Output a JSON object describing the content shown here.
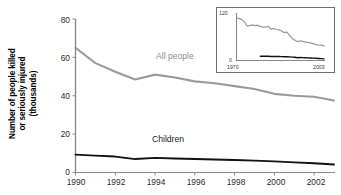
{
  "chart_data": {
    "type": "line",
    "title": "",
    "xlabel": "",
    "ylabel": "Number of people killed or seriously injured (thousands)",
    "ylabel_lines": [
      "Number of people killed",
      "or seriously injured",
      "(thousands)"
    ],
    "xlim": [
      1990,
      2003
    ],
    "ylim": [
      0,
      80
    ],
    "grid": false,
    "legend_position": "inline-annotations",
    "x_ticks": [
      "1990",
      "1992",
      "1994",
      "1996",
      "1998",
      "2000",
      "2002"
    ],
    "x_tick_values": [
      1990,
      1992,
      1994,
      1996,
      1998,
      2000,
      2002
    ],
    "y_ticks": [
      "0",
      "20",
      "40",
      "60",
      "80"
    ],
    "y_tick_values": [
      0,
      20,
      40,
      60,
      80
    ],
    "x": [
      1990,
      1991,
      1992,
      1993,
      1994,
      1995,
      1996,
      1997,
      1998,
      1999,
      2000,
      2001,
      2002,
      2003
    ],
    "series": [
      {
        "name": "All people",
        "color": "#9a9a9a",
        "values": [
          65.0,
          57.0,
          52.5,
          48.5,
          51.0,
          49.5,
          47.5,
          46.5,
          45.0,
          43.5,
          41.0,
          40.0,
          39.5,
          37.5
        ]
      },
      {
        "name": "Children",
        "color": "#111111",
        "values": [
          9.3,
          8.8,
          8.3,
          7.0,
          7.6,
          7.3,
          7.0,
          6.8,
          6.5,
          6.2,
          5.8,
          5.3,
          4.8,
          4.2
        ]
      }
    ],
    "annotations": [
      {
        "text": "All people",
        "x": 1995.2,
        "y": 56.0,
        "color": "#8d8d8d"
      },
      {
        "text": "Children",
        "x": 1995.1,
        "y": 16.5,
        "color": "#1a1a1a"
      }
    ],
    "inset": {
      "type": "line",
      "xlim": [
        1970,
        2003
      ],
      "ylim": [
        0,
        120
      ],
      "x_ticks": [
        "1970",
        "2003"
      ],
      "y_ticks": [
        "0",
        "120"
      ],
      "grid": false,
      "series": [
        {
          "name": "All people",
          "color": "#9a9a9a",
          "x": [
            1970,
            1971,
            1972,
            1973,
            1974,
            1975,
            1976,
            1977,
            1978,
            1979,
            1980,
            1981,
            1982,
            1983,
            1984,
            1985,
            1986,
            1987,
            1988,
            1989,
            1990,
            1991,
            1992,
            1993,
            1994,
            1995,
            1996,
            1997,
            1998,
            1999,
            2000,
            2001,
            2002,
            2003
          ],
          "values": [
            110.0,
            108.0,
            106.0,
            99.0,
            89.0,
            90.0,
            92.0,
            90.0,
            91.0,
            88.0,
            86.0,
            87.0,
            88.0,
            81.0,
            83.0,
            80.0,
            79.0,
            76.0,
            72.0,
            73.0,
            65.0,
            57.0,
            52.5,
            48.5,
            51.0,
            49.5,
            47.5,
            46.5,
            45.0,
            43.5,
            41.0,
            40.0,
            39.5,
            37.5
          ]
        },
        {
          "name": "Children",
          "color": "#111111",
          "x": [
            1979,
            1980,
            1981,
            1982,
            1983,
            1984,
            1985,
            1986,
            1987,
            1988,
            1989,
            1990,
            1991,
            1992,
            1993,
            1994,
            1995,
            1996,
            1997,
            1998,
            1999,
            2000,
            2001,
            2002,
            2003
          ],
          "values": [
            11.0,
            11.2,
            10.8,
            11.0,
            10.5,
            10.6,
            10.3,
            10.2,
            10.0,
            9.8,
            9.6,
            9.3,
            8.8,
            8.3,
            7.0,
            7.6,
            7.3,
            7.0,
            6.8,
            6.5,
            6.2,
            5.8,
            5.3,
            4.8,
            4.2
          ]
        }
      ]
    }
  },
  "colors": {
    "all_people": "#9a9a9a",
    "children": "#111111",
    "axis": "#8a8a8a",
    "inset_frame": "#6f6f6f"
  }
}
